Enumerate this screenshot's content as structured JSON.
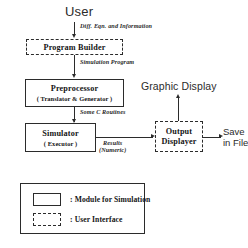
{
  "diagram": {
    "nodes": {
      "user": {
        "label": "User",
        "style": "plain-text"
      },
      "program_builder": {
        "label": "Program Builder",
        "style": "dashed"
      },
      "preprocessor": {
        "label": "Preprocessor",
        "sublabel": "( Translator & Generator )",
        "style": "solid"
      },
      "simulator": {
        "label": "Simulator",
        "sublabel": "( Executor )",
        "style": "solid"
      },
      "output_displayer": {
        "label_line1": "Output",
        "label_line2": "Displayer",
        "style": "dashed"
      },
      "graphic_display": {
        "label": "Graphic Display",
        "style": "plain-text"
      },
      "save_in_file": {
        "label_line1": "Save",
        "label_line2": "in File",
        "style": "plain-text"
      }
    },
    "edges": [
      {
        "from": "user",
        "to": "program_builder",
        "label": "Diff. Eqn. and Information"
      },
      {
        "from": "program_builder",
        "to": "preprocessor",
        "label": "Simulation Program"
      },
      {
        "from": "preprocessor",
        "to": "simulator",
        "label": "Some C Routines"
      },
      {
        "from": "simulator",
        "to": "output_displayer",
        "label_line1": "Results",
        "label_line2": "(Numeric)"
      },
      {
        "from": "output_displayer",
        "to": "graphic_display",
        "label": ""
      },
      {
        "from": "output_displayer",
        "to": "save_in_file",
        "label": ""
      }
    ],
    "legend": {
      "items": [
        {
          "swatch": "solid",
          "label": ": Module for Simulation"
        },
        {
          "swatch": "dashed",
          "label": ": User Interface"
        }
      ]
    },
    "colors": {
      "stroke": "#2b2b2b",
      "text": "#141414",
      "background": "#ffffff"
    }
  }
}
